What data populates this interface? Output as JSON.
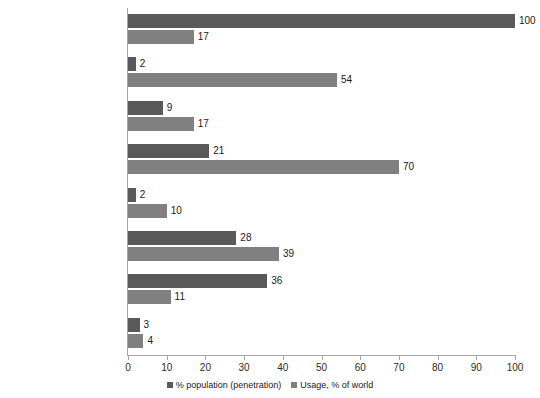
{
  "chart_data": {
    "type": "bar",
    "orientation": "horizontal",
    "title": "",
    "xlabel": "",
    "ylabel": "",
    "xlim": [
      0,
      100
    ],
    "xticks": [
      0,
      10,
      20,
      30,
      40,
      50,
      60,
      70,
      80,
      90,
      100
    ],
    "grid": false,
    "legend_position": "bottom",
    "categories": [
      "World total",
      "Oceania / Australia",
      "Latin America / Caribbean",
      "North America",
      "Middle East",
      "Europe",
      "Asia",
      "Africa"
    ],
    "series": [
      {
        "name": "% population (penetration)",
        "color": "#595959",
        "values": [
          100,
          2,
          9,
          21,
          2,
          28,
          36,
          3
        ]
      },
      {
        "name": "Usage, % of world",
        "color": "#808080",
        "values": [
          17,
          54,
          17,
          70,
          10,
          39,
          11,
          4
        ]
      }
    ]
  },
  "legend": {
    "entries": [
      {
        "label": "% population (penetration)",
        "color": "#595959"
      },
      {
        "label": "Usage, % of world",
        "color": "#808080"
      }
    ]
  }
}
